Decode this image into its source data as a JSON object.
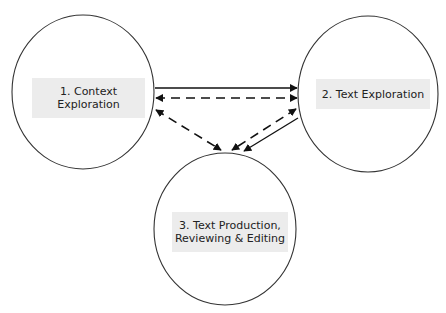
{
  "diagram": {
    "nodes": [
      {
        "id": "1",
        "lines": [
          "1. Context",
          "Exploration"
        ]
      },
      {
        "id": "2",
        "lines": [
          "2. Text Exploration"
        ]
      },
      {
        "id": "3",
        "lines": [
          "3. Text Production,",
          "Reviewing & Editing"
        ]
      }
    ],
    "edges": [
      {
        "from": "1",
        "to": "2",
        "style": "solid",
        "direction": "one-way"
      },
      {
        "from": "1",
        "to": "2",
        "style": "dashed",
        "direction": "two-way"
      },
      {
        "from": "1",
        "to": "3",
        "style": "dashed",
        "direction": "two-way"
      },
      {
        "from": "2",
        "to": "3",
        "style": "dashed",
        "direction": "two-way"
      },
      {
        "from": "2",
        "to": "3",
        "style": "solid",
        "direction": "one-way"
      }
    ],
    "colors": {
      "stroke": "#1a1a1a",
      "label_fill": "#ececec"
    }
  }
}
